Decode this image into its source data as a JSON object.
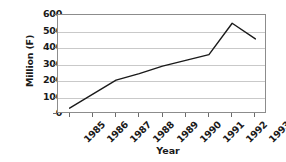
{
  "chart_data": {
    "type": "line",
    "title": "",
    "xlabel": "Year",
    "ylabel": "Million (F)",
    "categories": [
      "1985",
      "1986",
      "1987",
      "1988",
      "1989",
      "1990",
      "1991",
      "1992",
      "1993"
    ],
    "x": [
      1985,
      1986,
      1987,
      1988,
      1989,
      1990,
      1991,
      1992,
      1993
    ],
    "values": [
      35,
      120,
      205,
      245,
      290,
      325,
      360,
      550,
      455
    ],
    "series": [
      {
        "name": "Million (F)",
        "values": [
          35,
          120,
          205,
          245,
          290,
          325,
          360,
          550,
          455
        ]
      }
    ],
    "ylim": [
      0,
      600
    ],
    "ytick_labels": [
      "0",
      "100",
      "200",
      "300",
      "400",
      "500",
      "600"
    ],
    "yticks": [
      0,
      100,
      200,
      300,
      400,
      500,
      600
    ],
    "grid": true,
    "grid_axis": "y",
    "legend": false,
    "legend_position": "none",
    "line_color": "#1a1a1a",
    "grid_color": "#c9c9c9",
    "axis_color": "#8c8c8c",
    "background_color": "#ffffff",
    "markers": false
  },
  "axes": {
    "y_title": "Million (F)",
    "x_title": "Year"
  }
}
